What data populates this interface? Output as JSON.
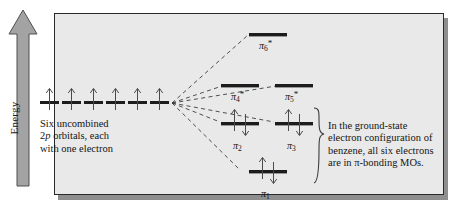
{
  "figure": {
    "axis": {
      "label": "Energy",
      "direction": "up"
    },
    "left_caption": {
      "line1": "Six uncombined",
      "line2_pre": "2",
      "line2_italic": "p",
      "line2_post": " orbitals, each",
      "line3": "with one electron"
    },
    "right_caption": {
      "line1": "In the ground-state",
      "line2": "electron configuration of",
      "line3": "benzene, all six electrons",
      "line4_pre": "are in ",
      "line4_pi": "π",
      "line4_post": "-bonding MOs."
    },
    "atomic_orbitals": {
      "count": 6,
      "electrons_each": 1,
      "spin": "up"
    },
    "mo_levels": [
      {
        "id": "pi6",
        "label": "π",
        "sub": "6",
        "star": "*",
        "electrons": 0,
        "tier": "antibonding-top"
      },
      {
        "id": "pi4",
        "label": "π",
        "sub": "4",
        "star": "*",
        "electrons": 0,
        "tier": "antibonding"
      },
      {
        "id": "pi5",
        "label": "π",
        "sub": "5",
        "star": "*",
        "electrons": 0,
        "tier": "antibonding"
      },
      {
        "id": "pi2",
        "label": "π",
        "sub": "2",
        "star": "",
        "electrons": 2,
        "tier": "bonding"
      },
      {
        "id": "pi3",
        "label": "π",
        "sub": "3",
        "star": "",
        "electrons": 2,
        "tier": "bonding"
      },
      {
        "id": "pi1",
        "label": "π",
        "sub": "1",
        "star": "",
        "electrons": 2,
        "tier": "bonding-lowest"
      }
    ],
    "colors": {
      "panel_background": "#e9e9e9",
      "panel_border": "#2a2a2a",
      "level_bar": "#1c1c1c",
      "arrow_gray": "#9a9a9a",
      "shadow": "#8e8e8e",
      "text": "#141414"
    }
  }
}
